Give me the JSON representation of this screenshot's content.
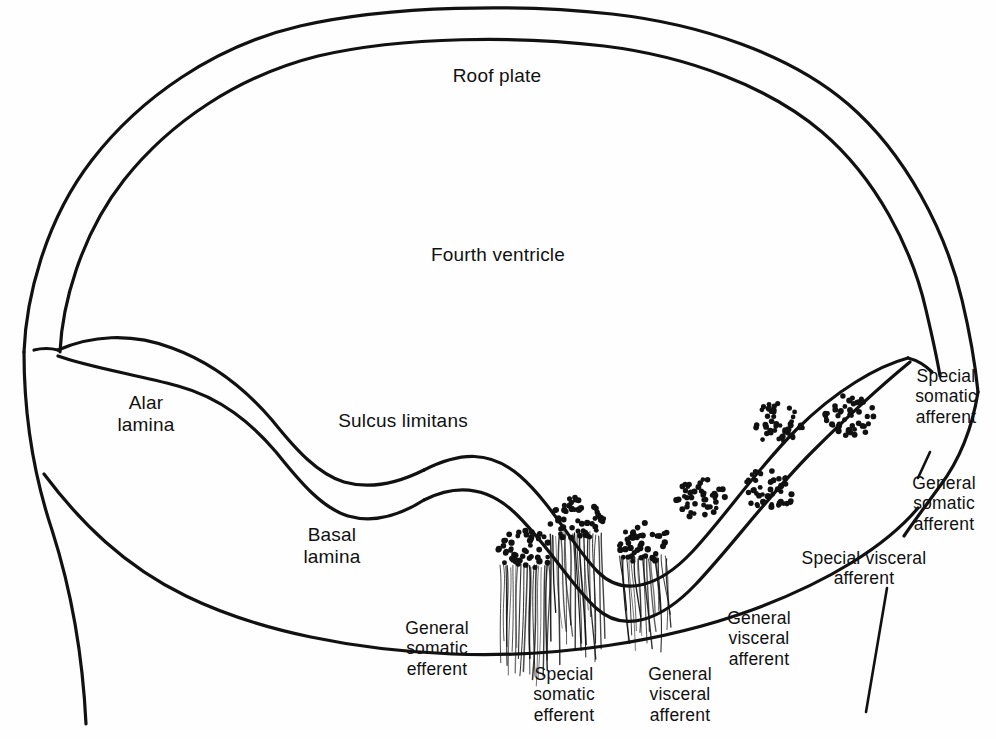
{
  "figure": {
    "kind": "anatomical-line-diagram",
    "line_color": "#111111",
    "background_color": "#ffffff",
    "dot_color": "#111111"
  },
  "labels": {
    "roof_plate": "Roof plate",
    "fourth_ventricle": "Fourth ventricle",
    "alar_lamina": "Alar\nlamina",
    "sulcus_limitans": "Sulcus limitans",
    "basal_lamina": "Basal\nlamina",
    "special_somatic_afferent": "Special\nsomatic\nafferent",
    "general_somatic_afferent": "General\nsomatic\nafferent",
    "special_visceral_afferent": "Special visceral\nafferent",
    "general_visceral_afferent": "General\nvisceral\nafferent",
    "general_somatic_efferent": "General\nsomatic\nefferent",
    "special_somatic_efferent": "Special\nsomatic\nefferent",
    "general_visceral_efferent": "General\nvisceral\nafferent"
  },
  "nuclei": {
    "afferent_columns": [
      {
        "name": "special-somatic-afferent-nucleus",
        "cx": 848,
        "cy": 414,
        "rx": 27,
        "ry": 23,
        "dots": 46
      },
      {
        "name": "general-somatic-afferent-nucleus",
        "cx": 777,
        "cy": 424,
        "rx": 26,
        "ry": 22,
        "dots": 44
      },
      {
        "name": "special-visceral-afferent-nucleus",
        "cx": 768,
        "cy": 491,
        "rx": 26,
        "ry": 22,
        "dots": 44
      },
      {
        "name": "general-visceral-afferent-nucleus",
        "cx": 700,
        "cy": 496,
        "rx": 26,
        "ry": 22,
        "dots": 44
      }
    ],
    "efferent_columns": [
      {
        "name": "general-visceral-efferent-nucleus",
        "cx": 643,
        "cy": 543,
        "rx": 26,
        "ry": 21,
        "dots": 42,
        "fiber_tilt": 7,
        "fiber_len": 86
      },
      {
        "name": "special-visceral-efferent-nucleus",
        "cx": 576,
        "cy": 519,
        "rx": 28,
        "ry": 23,
        "dots": 50,
        "fiber_tilt": 4,
        "fiber_len": 118
      },
      {
        "name": "general-somatic-efferent-nucleus",
        "cx": 525,
        "cy": 551,
        "rx": 27,
        "ry": 22,
        "dots": 46,
        "fiber_tilt": -2,
        "fiber_len": 112
      }
    ]
  }
}
